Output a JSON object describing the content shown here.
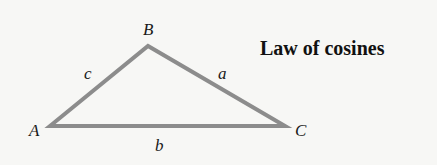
{
  "title": "Law of cosines",
  "vertices": {
    "A": {
      "label": "A"
    },
    "B": {
      "label": "B"
    },
    "C": {
      "label": "C"
    }
  },
  "sides": {
    "a": {
      "label": "a"
    },
    "b": {
      "label": "b"
    },
    "c": {
      "label": "c"
    }
  },
  "colors": {
    "triangle_stroke": "#8c8c8c",
    "background": "#f7f7f5",
    "text": "#111111"
  }
}
